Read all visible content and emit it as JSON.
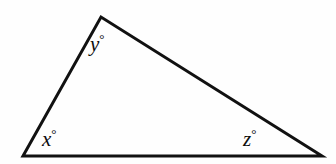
{
  "figure": {
    "name": "scalene-triangle-angle-diagram",
    "background_color": "#fefefe",
    "stroke_color": "#111111",
    "stroke_width": 3,
    "canvas": {
      "width": 336,
      "height": 164
    },
    "vertices": {
      "bottom_left": {
        "x": 23,
        "y": 156
      },
      "apex": {
        "x": 101,
        "y": 17
      },
      "bottom_right": {
        "x": 322,
        "y": 156
      }
    },
    "polygon_points": "23,156 101,17 322,156"
  },
  "labels": {
    "x": {
      "variable": "x",
      "degree_symbol": "°",
      "text": "x°"
    },
    "y": {
      "variable": "y",
      "degree_symbol": "°",
      "text": "y°"
    },
    "z": {
      "variable": "z",
      "degree_symbol": "°",
      "text": "z°"
    }
  }
}
